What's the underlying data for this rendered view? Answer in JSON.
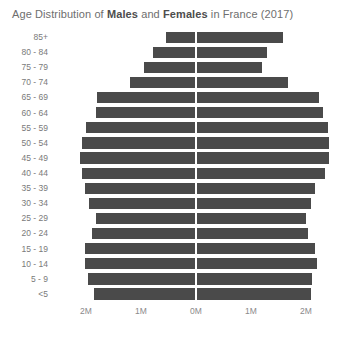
{
  "chart_data": {
    "type": "bar",
    "subtype": "population-pyramid",
    "title": "Age Distribution of Males and Females in France (2017)",
    "title_parts": [
      {
        "text": "Age Distribution of ",
        "bold": false
      },
      {
        "text": "Males",
        "bold": true
      },
      {
        "text": " and ",
        "bold": false
      },
      {
        "text": "Females",
        "bold": true
      },
      {
        "text": " in France (2017)",
        "bold": false
      }
    ],
    "xlabel": "",
    "ylabel": "",
    "grid": false,
    "legend": "none",
    "orientation": "horizontal",
    "bar_color": "#4a4a4a",
    "xlim": [
      -2.6,
      2.6
    ],
    "x_unit": "M",
    "x_ticks": [
      {
        "label": "2M",
        "value": -2
      },
      {
        "label": "1M",
        "value": -1
      },
      {
        "label": "0M",
        "value": 0
      },
      {
        "label": "1M",
        "value": 1
      },
      {
        "label": "2M",
        "value": 2
      }
    ],
    "categories": [
      "85+",
      "80 - 84",
      "75 - 79",
      "70 - 74",
      "65 - 69",
      "60 - 64",
      "55 - 59",
      "50 - 54",
      "45 - 49",
      "40 - 44",
      "35 - 39",
      "30 - 34",
      "25 - 29",
      "20 - 24",
      "15 - 19",
      "10 - 14",
      "5 - 9",
      "<5"
    ],
    "series": [
      {
        "name": "Males",
        "side": "left",
        "values": [
          0.53,
          0.77,
          0.93,
          1.18,
          1.78,
          1.8,
          1.98,
          2.05,
          2.09,
          2.05,
          2.0,
          1.93,
          1.8,
          1.87,
          2.0,
          2.0,
          1.95,
          1.84
        ]
      },
      {
        "name": "Females",
        "side": "right",
        "values": [
          1.56,
          1.27,
          1.18,
          1.65,
          2.22,
          2.29,
          2.38,
          2.4,
          2.4,
          2.33,
          2.15,
          2.07,
          1.98,
          2.02,
          2.15,
          2.18,
          2.09,
          2.07
        ]
      }
    ]
  }
}
